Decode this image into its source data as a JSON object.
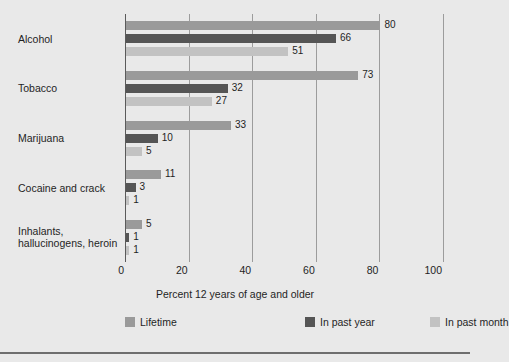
{
  "chart_data": {
    "type": "bar",
    "orientation": "horizontal",
    "title": "",
    "xlabel": "Percent 12 years of age and older",
    "ylabel": "",
    "xlim": [
      0,
      100
    ],
    "xticks": [
      0,
      20,
      40,
      60,
      80,
      100
    ],
    "grid": true,
    "legend_position": "bottom",
    "categories": [
      "Alcohol",
      "Tobacco",
      "Marijuana",
      "Cocaine and crack",
      "Inhalants, hallucinogens, heroin"
    ],
    "category_lines": [
      [
        "Alcohol"
      ],
      [
        "Tobacco"
      ],
      [
        "Marijuana"
      ],
      [
        "Cocaine and crack"
      ],
      [
        "Inhalants,",
        "hallucinogens, heroin"
      ]
    ],
    "series": [
      {
        "name": "Lifetime",
        "color": "#9a9a9a",
        "values": [
          80,
          73,
          33,
          11,
          5
        ]
      },
      {
        "name": "In past year",
        "color": "#555555",
        "values": [
          66,
          32,
          10,
          3,
          1
        ]
      },
      {
        "name": "In past month",
        "color": "#c2c2c2",
        "values": [
          51,
          27,
          5,
          1,
          1
        ]
      }
    ]
  },
  "legend": {
    "items": [
      {
        "label": "Lifetime",
        "color": "#9a9a9a"
      },
      {
        "label": "In past year",
        "color": "#555555"
      },
      {
        "label": "In past month",
        "color": "#c2c2c2"
      }
    ]
  },
  "axis": {
    "x_title": "Percent 12 years of age and older",
    "tick_labels": [
      "0",
      "20",
      "40",
      "60",
      "80",
      "100"
    ]
  },
  "colors": {
    "background": "#e9e9e9",
    "gridline": "#9c9c9c",
    "axis": "#5a5a5a",
    "text": "#1f1f1f",
    "bottom_rule": "#6e6e6e"
  }
}
